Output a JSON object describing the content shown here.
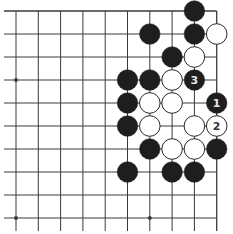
{
  "board": {
    "grid_x": [
      16,
      38.3,
      60.6,
      82.9,
      105.2,
      127.5,
      149.8,
      172.1,
      194.4,
      216.7
    ],
    "grid_y": [
      11,
      34,
      57,
      80,
      103,
      126,
      149,
      172,
      195,
      218
    ],
    "line_color": "#3a3a3a",
    "background": "#ffffff",
    "top_edge": true,
    "right_edge": true,
    "star_points": [
      [
        0,
        3
      ],
      [
        0,
        9
      ],
      [
        6,
        9
      ]
    ],
    "stone_radius": 10.3,
    "colors": {
      "black": "#1e1e1e",
      "white": "#ffffff",
      "white_border": "#2a2a2a",
      "label_on_black": "#e6e6e6",
      "label_on_white": "#333333"
    }
  },
  "stones": [
    {
      "col": 8,
      "row": 0,
      "color": "black",
      "label": ""
    },
    {
      "col": 6,
      "row": 1,
      "color": "black",
      "label": ""
    },
    {
      "col": 8,
      "row": 1,
      "color": "black",
      "label": ""
    },
    {
      "col": 9,
      "row": 1,
      "color": "white",
      "label": ""
    },
    {
      "col": 7,
      "row": 2,
      "color": "black",
      "label": ""
    },
    {
      "col": 8,
      "row": 2,
      "color": "white",
      "label": ""
    },
    {
      "col": 5,
      "row": 3,
      "color": "black",
      "label": ""
    },
    {
      "col": 6,
      "row": 3,
      "color": "black",
      "label": ""
    },
    {
      "col": 7,
      "row": 3,
      "color": "white",
      "label": ""
    },
    {
      "col": 8,
      "row": 3,
      "color": "black",
      "label": "3"
    },
    {
      "col": 5,
      "row": 4,
      "color": "black",
      "label": ""
    },
    {
      "col": 6,
      "row": 4,
      "color": "white",
      "label": ""
    },
    {
      "col": 7,
      "row": 4,
      "color": "white",
      "label": ""
    },
    {
      "col": 9,
      "row": 4,
      "color": "black",
      "label": "1"
    },
    {
      "col": 5,
      "row": 5,
      "color": "black",
      "label": ""
    },
    {
      "col": 6,
      "row": 5,
      "color": "white",
      "label": ""
    },
    {
      "col": 8,
      "row": 5,
      "color": "white",
      "label": ""
    },
    {
      "col": 9,
      "row": 5,
      "color": "white",
      "label": "2"
    },
    {
      "col": 6,
      "row": 6,
      "color": "black",
      "label": ""
    },
    {
      "col": 7,
      "row": 6,
      "color": "white",
      "label": ""
    },
    {
      "col": 8,
      "row": 6,
      "color": "white",
      "label": ""
    },
    {
      "col": 9,
      "row": 6,
      "color": "black",
      "label": ""
    },
    {
      "col": 5,
      "row": 7,
      "color": "black",
      "label": ""
    },
    {
      "col": 7,
      "row": 7,
      "color": "black",
      "label": ""
    },
    {
      "col": 8,
      "row": 7,
      "color": "black",
      "label": ""
    }
  ]
}
